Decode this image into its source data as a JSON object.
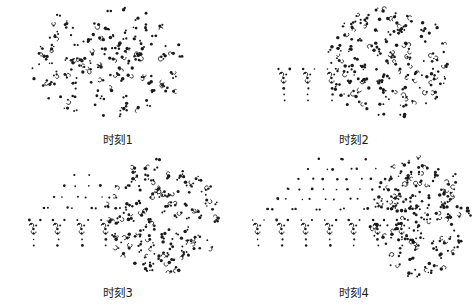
{
  "figure": {
    "background_color": "#ffffff",
    "marker_color": "#1a1a1a",
    "layout": "2x2 grid of simulation snapshots",
    "width": 472,
    "height": 306
  },
  "panels": [
    {
      "id": "panel-1",
      "caption": "时刻1"
    },
    {
      "id": "panel-2",
      "caption": "时刻2"
    },
    {
      "id": "panel-3",
      "caption": "时刻3"
    },
    {
      "id": "panel-4",
      "caption": "时刻4"
    }
  ],
  "chart_data": {
    "type": "scatter",
    "title": "",
    "xlabel": "",
    "ylabel": "",
    "grid": false,
    "legend": null,
    "axes_visible": false,
    "panel_count": 4,
    "panel_layout": [
      2,
      2
    ],
    "panels": [
      {
        "name": "时刻1",
        "caption": "时刻1",
        "xlim": [
          0,
          236
        ],
        "ylim": [
          0,
          128
        ],
        "clusters": [
          {
            "name": "disordered-cluster",
            "state": "disordered",
            "shape": "round-blob",
            "center": [
              108,
              62
            ],
            "radius_x": 78,
            "radius_y": 55,
            "point_count": 150,
            "seed": 11
          }
        ],
        "lattice": null
      },
      {
        "name": "时刻2",
        "caption": "时刻2",
        "xlim": [
          0,
          236
        ],
        "ylim": [
          0,
          128
        ],
        "clusters": [
          {
            "name": "disordered-cluster",
            "state": "disordered",
            "shape": "round-blob",
            "center": [
              152,
              62
            ],
            "radius_x": 62,
            "radius_y": 56,
            "point_count": 155,
            "seed": 22
          }
        ],
        "lattice": {
          "name": "crystal-lattice",
          "state": "ordered",
          "columns": 3,
          "rows": 0,
          "origin": [
            36,
            70
          ],
          "col_spacing": 24,
          "row_spacing": 11,
          "apex_rows": 0,
          "stub_points": 3
        }
      },
      {
        "name": "时刻3",
        "caption": "时刻3",
        "xlim": [
          0,
          236
        ],
        "ylim": [
          0,
          128
        ],
        "clusters": [
          {
            "name": "disordered-cluster",
            "state": "disordered",
            "shape": "round-blob",
            "center": [
              162,
              62
            ],
            "radius_x": 58,
            "radius_y": 56,
            "point_count": 158,
            "seed": 33
          }
        ],
        "lattice": {
          "name": "crystal-lattice",
          "state": "ordered",
          "columns": 4,
          "rows": 4,
          "origin": [
            22,
            68
          ],
          "col_spacing": 24,
          "row_spacing": 11,
          "apex_rows": 4,
          "stub_points": 2
        }
      },
      {
        "name": "时刻4",
        "caption": "时刻4",
        "xlim": [
          0,
          236
        ],
        "ylim": [
          0,
          128
        ],
        "clusters": [
          {
            "name": "disordered-cluster",
            "state": "disordered",
            "shape": "round-blob",
            "center": [
              182,
              64
            ],
            "radius_x": 50,
            "radius_y": 58,
            "point_count": 160,
            "seed": 44
          }
        ],
        "lattice": {
          "name": "crystal-lattice",
          "state": "ordered",
          "columns": 7,
          "rows": 7,
          "origin": [
            10,
            68
          ],
          "col_spacing": 24,
          "row_spacing": 10,
          "apex_rows": 7,
          "stub_points": 2
        }
      }
    ]
  }
}
